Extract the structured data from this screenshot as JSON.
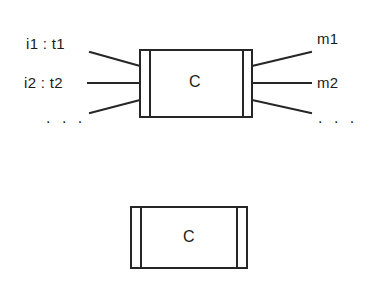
{
  "diagram": {
    "stroke_color": "#262626",
    "fill_color": "#ffffff",
    "background": "#ffffff",
    "figures": [
      {
        "id": "detailed-component",
        "box_label": "C",
        "inputs": [
          {
            "id": "in-1",
            "label": "i1 : t1"
          },
          {
            "id": "in-2",
            "label": "i2 : t2"
          },
          {
            "id": "in-more",
            "label": ". . ."
          }
        ],
        "outputs": [
          {
            "id": "out-1",
            "label": "m1"
          },
          {
            "id": "out-2",
            "label": "m2"
          },
          {
            "id": "out-more",
            "label": ". . ."
          }
        ]
      },
      {
        "id": "abstract-component",
        "box_label": "C",
        "inputs": [],
        "outputs": []
      }
    ]
  },
  "labels": {
    "input_1": "i1 : t1",
    "input_2": "i2 : t2",
    "input_ellipsis": ". . .",
    "output_1": "m1",
    "output_2": "m2",
    "output_ellipsis": ". . .",
    "component_main": "C",
    "component_abstract": "C"
  }
}
